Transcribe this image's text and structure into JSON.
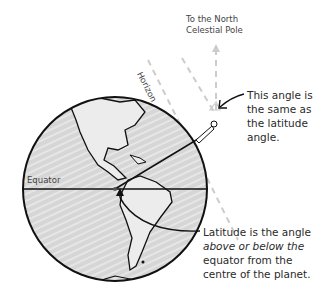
{
  "labels": {
    "north_pole": [
      "To the North",
      "Celestial Pole"
    ],
    "horizon": "Horizon",
    "equator": "Equator",
    "angle_note": [
      "This angle is",
      "the same as",
      "the latitude",
      "angle."
    ],
    "latitude_note": [
      "Latitude is the angle",
      "above or below the",
      "equator from the",
      "centre of the planet."
    ]
  },
  "colors": {
    "ink": "#1a1a1a",
    "globe_fill": "#d9d9d9",
    "dashed": "#c8c8c8"
  }
}
